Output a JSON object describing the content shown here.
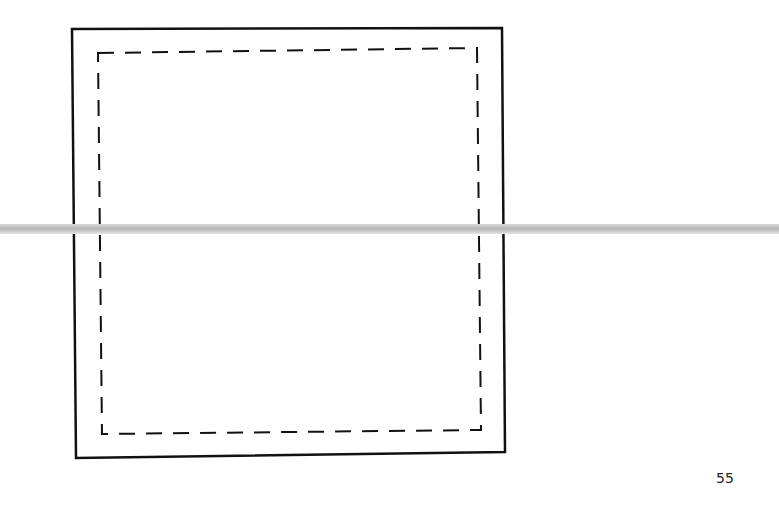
{
  "document": {
    "page_number": "55",
    "figure": {
      "outer_square": {
        "style": "solid",
        "stroke": "#111111"
      },
      "inner_square": {
        "style": "dashed",
        "stroke": "#111111"
      }
    },
    "scan_artifact": {
      "type": "horizontal-band",
      "color": "#c0c0c0"
    }
  }
}
